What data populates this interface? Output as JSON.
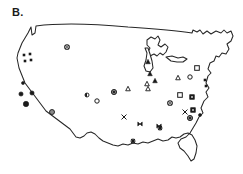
{
  "figure": {
    "panel_label": "B.",
    "type": "distribution-map",
    "region": "Contiguous United States"
  },
  "chart_data": {
    "type": "scatter",
    "title": "B.",
    "subtitle": "",
    "xlabel": "",
    "ylabel": "",
    "projection": "contiguous-united-states-outline",
    "grid": false,
    "legend_position": "none",
    "xlim": [
      0,
      243
    ],
    "ylim": [
      0,
      174
    ],
    "axis_visible": false,
    "marker_types": [
      {
        "key": "filled-circle-small",
        "symbol": "●",
        "fill": "#1a1a1a",
        "stroke": "#1a1a1a",
        "size": 3.0
      },
      {
        "key": "filled-circle-medium",
        "symbol": "●",
        "fill": "#1a1a1a",
        "stroke": "#1a1a1a",
        "size": 4.2
      },
      {
        "key": "filled-circle-large",
        "symbol": "●",
        "fill": "#1a1a1a",
        "stroke": "#1a1a1a",
        "size": 5.4
      },
      {
        "key": "gray-circle",
        "symbol": "◉",
        "fill": "#8a8a8a",
        "stroke": "#1a1a1a",
        "size": 5.0
      },
      {
        "key": "gray-circle-dark-core",
        "symbol": "◉",
        "fill": "#7d7d7d",
        "stroke": "#1a1a1a",
        "size": 5.2
      },
      {
        "key": "open-circle",
        "symbol": "○",
        "fill": "#ffffff",
        "stroke": "#1a1a1a",
        "size": 4.4
      },
      {
        "key": "open-circle-ringed",
        "symbol": "◎",
        "fill": "#ffffff",
        "stroke": "#1a1a1a",
        "size": 4.6
      },
      {
        "key": "half-filled-circle",
        "symbol": "◐",
        "fill": "#1a1a1a",
        "stroke": "#1a1a1a",
        "size": 4.0
      },
      {
        "key": "filled-triangle",
        "symbol": "▲",
        "fill": "#1a1a1a",
        "stroke": "#1a1a1a",
        "size": 4.6
      },
      {
        "key": "open-triangle",
        "symbol": "△",
        "fill": "#ffffff",
        "stroke": "#1a1a1a",
        "size": 4.6
      },
      {
        "key": "open-square",
        "symbol": "□",
        "fill": "#ffffff",
        "stroke": "#1a1a1a",
        "size": 4.6
      },
      {
        "key": "filled-square",
        "symbol": "■",
        "fill": "#1a1a1a",
        "stroke": "#1a1a1a",
        "size": 4.6
      },
      {
        "key": "small-filled-square",
        "symbol": "▪",
        "fill": "#1a1a1a",
        "stroke": "#1a1a1a",
        "size": 2.6
      },
      {
        "key": "x-mark",
        "symbol": "✕",
        "fill": "none",
        "stroke": "#1a1a1a",
        "size": 4.4
      },
      {
        "key": "bowtie",
        "symbol": "⋈",
        "fill": "#1a1a1a",
        "stroke": "#1a1a1a",
        "size": 4.4
      },
      {
        "key": "asterisk",
        "symbol": "✳",
        "fill": "#1a1a1a",
        "stroke": "#1a1a1a",
        "size": 4.4
      }
    ],
    "points": [
      {
        "x": 24,
        "y": 55,
        "type": "small-filled-square"
      },
      {
        "x": 30,
        "y": 54,
        "type": "small-filled-square"
      },
      {
        "x": 25,
        "y": 61,
        "type": "small-filled-square"
      },
      {
        "x": 31,
        "y": 60,
        "type": "small-filled-square"
      },
      {
        "x": 23,
        "y": 83,
        "type": "filled-circle-small"
      },
      {
        "x": 21,
        "y": 94,
        "type": "filled-circle-medium"
      },
      {
        "x": 32,
        "y": 93,
        "type": "filled-circle-medium"
      },
      {
        "x": 26,
        "y": 104,
        "type": "filled-circle-large"
      },
      {
        "x": 52,
        "y": 112,
        "type": "gray-circle"
      },
      {
        "x": 67,
        "y": 47,
        "type": "open-circle-ringed"
      },
      {
        "x": 87,
        "y": 95,
        "type": "half-filled-circle"
      },
      {
        "x": 97,
        "y": 101,
        "type": "open-circle"
      },
      {
        "x": 114,
        "y": 92,
        "type": "gray-circle-dark-core"
      },
      {
        "x": 128,
        "y": 89,
        "type": "open-triangle"
      },
      {
        "x": 124,
        "y": 117,
        "type": "x-mark"
      },
      {
        "x": 140,
        "y": 124,
        "type": "bowtie"
      },
      {
        "x": 133,
        "y": 141,
        "type": "asterisk"
      },
      {
        "x": 148,
        "y": 62,
        "type": "filled-triangle"
      },
      {
        "x": 150,
        "y": 74,
        "type": "filled-triangle"
      },
      {
        "x": 147,
        "y": 84,
        "type": "open-triangle"
      },
      {
        "x": 155,
        "y": 81,
        "type": "filled-triangle"
      },
      {
        "x": 148,
        "y": 89,
        "type": "open-triangle"
      },
      {
        "x": 159,
        "y": 126,
        "type": "bowtie"
      },
      {
        "x": 160,
        "y": 128,
        "type": "asterisk"
      },
      {
        "x": 178,
        "y": 78,
        "type": "open-triangle"
      },
      {
        "x": 190,
        "y": 77,
        "type": "open-circle"
      },
      {
        "x": 197,
        "y": 68,
        "type": "open-square"
      },
      {
        "x": 180,
        "y": 95,
        "type": "open-square"
      },
      {
        "x": 170,
        "y": 103,
        "type": "open-circle-ringed"
      },
      {
        "x": 192,
        "y": 97,
        "type": "filled-square"
      },
      {
        "x": 185,
        "y": 112,
        "type": "x-mark"
      },
      {
        "x": 193,
        "y": 110,
        "type": "filled-square"
      },
      {
        "x": 190,
        "y": 118,
        "type": "gray-circle-dark-core"
      },
      {
        "x": 200,
        "y": 115,
        "type": "filled-circle-small"
      },
      {
        "x": 205,
        "y": 80,
        "type": "small-filled-square"
      },
      {
        "x": 206,
        "y": 86,
        "type": "small-filled-square"
      }
    ]
  },
  "colors": {
    "outline_stroke": "#262626",
    "marker_dark": "#1a1a1a",
    "marker_gray": "#8a8a8a",
    "background": "#ffffff"
  }
}
